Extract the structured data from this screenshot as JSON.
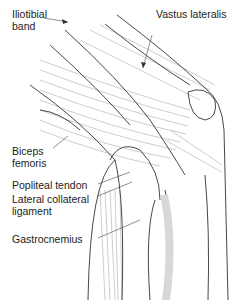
{
  "figure": {
    "labels": {
      "iliotibial_band_line1": "Iliotibial",
      "iliotibial_band_line2": "band",
      "vastus_lateralis": "Vastus lateralis",
      "biceps_femoris_line1": "Biceps",
      "biceps_femoris_line2": "femoris",
      "popliteal_tendon": "Popliteal tendon",
      "lateral_collateral_line1": "Lateral collateral",
      "lateral_collateral_line2": "ligament",
      "gastrocnemius": "Gastrocnemius"
    },
    "colors": {
      "line": "#333333",
      "fiber": "#9a9a9a",
      "shade": "#d8d8d8",
      "text": "#222222"
    }
  }
}
